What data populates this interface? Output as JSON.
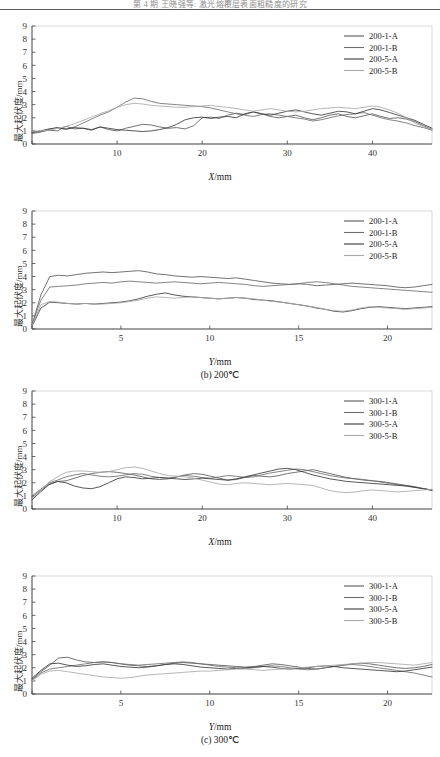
{
  "header": {
    "running_head": "第 4 期           王晓强等: 激光熔覆层表面粗糙度的研究",
    "visible": true
  },
  "axis_labels": {
    "y_title": "最大起伏度/mm",
    "x_title_x": "X",
    "x_title_y": "Y",
    "unit": "/mm"
  },
  "colors": {
    "series_a1": "#5a5a5a",
    "series_b1": "#6e6e6e",
    "series_a5": "#3a3a3a",
    "series_b5": "#a9a9a9",
    "axis": "#444444",
    "text": "#222222"
  },
  "chart_data": [
    {
      "id": "panel-a-x",
      "type": "line",
      "title": "",
      "xlabel": "X/mm",
      "ylabel": "最大起伏度/mm",
      "xlim": [
        0,
        47
      ],
      "ylim": [
        0,
        9
      ],
      "xticks": [
        0,
        10,
        20,
        30,
        40
      ],
      "yticks": [
        0,
        1,
        2,
        3,
        4,
        5,
        6,
        7,
        8,
        9
      ],
      "grid": false,
      "legend_position": "top-right",
      "x": [
        0,
        1,
        2,
        3,
        4,
        5,
        6,
        7,
        8,
        9,
        10,
        11,
        12,
        13,
        14,
        15,
        16,
        17,
        18,
        19,
        20,
        21,
        22,
        23,
        24,
        25,
        26,
        27,
        28,
        29,
        30,
        31,
        32,
        33,
        34,
        35,
        36,
        37,
        38,
        39,
        40,
        41,
        42,
        43,
        44,
        45,
        46,
        47
      ],
      "series": [
        {
          "name": "200-1-A",
          "values": [
            0.85,
            0.95,
            1.05,
            1.0,
            1.35,
            1.15,
            1.2,
            1.05,
            1.3,
            1.1,
            1.0,
            1.2,
            1.35,
            1.5,
            1.45,
            1.3,
            1.2,
            1.25,
            1.15,
            1.4,
            2.0,
            2.05,
            1.95,
            2.2,
            2.35,
            2.25,
            2.45,
            2.3,
            2.1,
            2.0,
            2.1,
            2.2,
            2.0,
            1.85,
            2.0,
            2.2,
            2.3,
            2.1,
            2.0,
            2.15,
            2.3,
            2.1,
            1.95,
            2.0,
            1.9,
            1.7,
            1.4,
            1.1
          ]
        },
        {
          "name": "200-1-B",
          "values": [
            0.8,
            0.9,
            1.1,
            1.25,
            1.1,
            1.3,
            1.6,
            1.9,
            2.2,
            2.45,
            2.8,
            3.2,
            3.5,
            3.45,
            3.25,
            3.1,
            3.05,
            3.0,
            2.95,
            2.9,
            2.85,
            2.75,
            2.6,
            2.45,
            2.3,
            2.2,
            2.1,
            2.25,
            2.3,
            2.2,
            2.1,
            2.0,
            1.9,
            1.75,
            1.85,
            2.0,
            2.15,
            2.25,
            2.3,
            2.4,
            2.2,
            2.0,
            1.85,
            1.75,
            1.6,
            1.4,
            1.25,
            1.05
          ]
        },
        {
          "name": "200-5-A",
          "values": [
            0.9,
            1.0,
            1.15,
            1.25,
            1.15,
            1.25,
            1.2,
            1.1,
            1.3,
            1.2,
            1.1,
            1.05,
            1.0,
            0.95,
            1.0,
            1.1,
            1.25,
            1.5,
            1.85,
            2.0,
            2.05,
            1.95,
            2.05,
            2.1,
            2.0,
            2.3,
            2.45,
            2.3,
            2.2,
            2.35,
            2.5,
            2.6,
            2.45,
            2.3,
            2.2,
            2.35,
            2.5,
            2.45,
            2.3,
            2.5,
            2.7,
            2.6,
            2.4,
            2.2,
            2.0,
            1.8,
            1.5,
            1.2
          ]
        },
        {
          "name": "200-5-B",
          "values": [
            0.95,
            1.0,
            1.05,
            1.2,
            1.35,
            1.55,
            1.8,
            2.05,
            2.3,
            2.55,
            2.8,
            3.0,
            3.1,
            3.05,
            2.95,
            2.9,
            2.85,
            2.8,
            2.8,
            2.85,
            2.9,
            2.95,
            2.85,
            2.8,
            2.7,
            2.6,
            2.5,
            2.6,
            2.7,
            2.6,
            2.5,
            2.45,
            2.5,
            2.6,
            2.7,
            2.75,
            2.8,
            2.75,
            2.7,
            2.8,
            2.9,
            2.8,
            2.6,
            2.35,
            2.0,
            1.6,
            1.3,
            1.1
          ]
        }
      ]
    },
    {
      "id": "panel-b-y",
      "type": "line",
      "title": "(b) 200℃",
      "xlabel": "Y/mm",
      "ylabel": "最大起伏度/mm",
      "xlim": [
        0,
        22.5
      ],
      "ylim": [
        0,
        9
      ],
      "xticks": [
        0,
        5,
        10,
        15,
        20
      ],
      "yticks": [
        0,
        1,
        2,
        3,
        4,
        5,
        6,
        7,
        8,
        9
      ],
      "grid": false,
      "legend_position": "top-right",
      "x": [
        0,
        0.5,
        1,
        1.5,
        2,
        2.5,
        3,
        3.5,
        4,
        4.5,
        5,
        5.5,
        6,
        6.5,
        7,
        7.5,
        8,
        8.5,
        9,
        9.5,
        10,
        10.5,
        11,
        11.5,
        12,
        12.5,
        13,
        13.5,
        14,
        14.5,
        15,
        15.5,
        16,
        16.5,
        17,
        17.5,
        18,
        18.5,
        19,
        19.5,
        20,
        20.5,
        21,
        21.5,
        22,
        22.5
      ],
      "series": [
        {
          "name": "200-1-A",
          "values": [
            0.3,
            2.6,
            4.0,
            4.1,
            4.05,
            4.15,
            4.25,
            4.3,
            4.35,
            4.3,
            4.35,
            4.4,
            4.45,
            4.35,
            4.2,
            4.15,
            4.05,
            4.0,
            3.95,
            4.0,
            3.95,
            3.9,
            3.85,
            3.9,
            3.8,
            3.7,
            3.6,
            3.5,
            3.45,
            3.4,
            3.45,
            3.4,
            3.3,
            3.35,
            3.4,
            3.45,
            3.5,
            3.45,
            3.4,
            3.35,
            3.3,
            3.2,
            3.15,
            3.2,
            3.3,
            3.4
          ]
        },
        {
          "name": "200-1-B",
          "values": [
            0.35,
            2.2,
            3.2,
            3.25,
            3.3,
            3.35,
            3.45,
            3.5,
            3.55,
            3.5,
            3.6,
            3.65,
            3.6,
            3.55,
            3.5,
            3.55,
            3.6,
            3.55,
            3.5,
            3.45,
            3.5,
            3.55,
            3.5,
            3.45,
            3.4,
            3.3,
            3.25,
            3.3,
            3.35,
            3.4,
            3.45,
            3.55,
            3.6,
            3.55,
            3.45,
            3.35,
            3.25,
            3.2,
            3.15,
            3.1,
            3.05,
            3.0,
            2.95,
            2.9,
            2.85,
            2.8
          ]
        },
        {
          "name": "200-5-A",
          "values": [
            0.2,
            1.6,
            2.05,
            2.0,
            1.95,
            1.9,
            1.95,
            1.9,
            1.95,
            2.0,
            2.05,
            2.15,
            2.3,
            2.5,
            2.65,
            2.75,
            2.6,
            2.5,
            2.45,
            2.4,
            2.35,
            2.3,
            2.35,
            2.4,
            2.35,
            2.25,
            2.2,
            2.15,
            2.05,
            1.95,
            1.85,
            1.75,
            1.6,
            1.5,
            1.35,
            1.3,
            1.4,
            1.55,
            1.65,
            1.7,
            1.65,
            1.6,
            1.55,
            1.6,
            1.65,
            1.7
          ]
        },
        {
          "name": "200-5-B",
          "values": [
            0.25,
            1.85,
            2.1,
            2.05,
            1.95,
            1.9,
            1.95,
            1.9,
            1.9,
            1.95,
            2.0,
            2.1,
            2.2,
            2.35,
            2.45,
            2.4,
            2.35,
            2.4,
            2.45,
            2.4,
            2.35,
            2.3,
            2.35,
            2.4,
            2.35,
            2.3,
            2.2,
            2.1,
            2.05,
            1.95,
            1.85,
            1.75,
            1.65,
            1.5,
            1.4,
            1.35,
            1.45,
            1.6,
            1.7,
            1.65,
            1.6,
            1.55,
            1.5,
            1.55,
            1.6,
            1.65
          ]
        }
      ]
    },
    {
      "id": "panel-c-x",
      "type": "line",
      "title": "",
      "xlabel": "X/mm",
      "ylabel": "最大起伏度/mm",
      "xlim": [
        0,
        47
      ],
      "ylim": [
        0,
        9
      ],
      "xticks": [
        0,
        10,
        20,
        30,
        40
      ],
      "yticks": [
        0,
        1,
        2,
        3,
        4,
        5,
        6,
        7,
        8,
        9
      ],
      "grid": false,
      "legend_position": "top-right",
      "x": [
        0,
        1,
        2,
        3,
        4,
        5,
        6,
        7,
        8,
        9,
        10,
        11,
        12,
        13,
        14,
        15,
        16,
        17,
        18,
        19,
        20,
        21,
        22,
        23,
        24,
        25,
        26,
        27,
        28,
        29,
        30,
        31,
        32,
        33,
        34,
        35,
        36,
        37,
        38,
        39,
        40,
        41,
        42,
        43,
        44,
        45,
        46,
        47
      ],
      "series": [
        {
          "name": "300-1-A",
          "values": [
            0.9,
            1.4,
            1.9,
            2.1,
            2.15,
            2.35,
            2.55,
            2.7,
            2.8,
            2.85,
            2.8,
            2.7,
            2.6,
            2.45,
            2.3,
            2.25,
            2.3,
            2.45,
            2.6,
            2.7,
            2.65,
            2.5,
            2.35,
            2.2,
            2.25,
            2.4,
            2.55,
            2.5,
            2.45,
            2.55,
            2.7,
            2.8,
            2.9,
            3.0,
            2.85,
            2.7,
            2.55,
            2.4,
            2.3,
            2.2,
            2.15,
            2.1,
            2.0,
            1.9,
            1.8,
            1.7,
            1.55,
            1.45
          ]
        },
        {
          "name": "300-1-B",
          "values": [
            1.0,
            1.5,
            2.0,
            2.2,
            2.45,
            2.6,
            2.7,
            2.6,
            2.5,
            2.45,
            2.5,
            2.6,
            2.7,
            2.65,
            2.5,
            2.4,
            2.35,
            2.45,
            2.55,
            2.5,
            2.4,
            2.35,
            2.45,
            2.55,
            2.5,
            2.4,
            2.45,
            2.6,
            2.75,
            2.85,
            2.95,
            3.05,
            3.0,
            2.85,
            2.7,
            2.55,
            2.45,
            2.35,
            2.3,
            2.25,
            2.15,
            2.05,
            1.95,
            1.85,
            1.75,
            1.65,
            1.55,
            1.4
          ]
        },
        {
          "name": "300-5-A",
          "values": [
            0.7,
            1.3,
            1.85,
            2.1,
            2.0,
            1.75,
            1.6,
            1.55,
            1.7,
            2.0,
            2.3,
            2.45,
            2.4,
            2.3,
            2.35,
            2.4,
            2.35,
            2.3,
            2.25,
            2.3,
            2.35,
            2.3,
            2.25,
            2.2,
            2.3,
            2.45,
            2.6,
            2.75,
            2.9,
            3.05,
            3.1,
            3.0,
            2.8,
            2.6,
            2.45,
            2.3,
            2.2,
            2.1,
            2.05,
            2.0,
            1.95,
            1.9,
            1.85,
            1.8,
            1.75,
            1.65,
            1.55,
            1.45
          ]
        },
        {
          "name": "300-5-B",
          "values": [
            0.8,
            1.45,
            2.05,
            2.45,
            2.8,
            2.9,
            2.9,
            2.85,
            2.8,
            2.85,
            3.0,
            3.15,
            3.2,
            3.1,
            2.9,
            2.7,
            2.55,
            2.5,
            2.45,
            2.35,
            2.2,
            2.05,
            1.9,
            1.85,
            1.95,
            2.0,
            1.95,
            1.9,
            1.85,
            1.9,
            1.95,
            1.9,
            1.85,
            1.8,
            1.6,
            1.4,
            1.3,
            1.25,
            1.3,
            1.4,
            1.45,
            1.4,
            1.35,
            1.3,
            1.35,
            1.4,
            1.45,
            1.5
          ]
        }
      ]
    },
    {
      "id": "panel-d-y",
      "type": "line",
      "title": "(c) 300℃",
      "xlabel": "Y/mm",
      "ylabel": "最大起伏度/mm",
      "xlim": [
        0,
        22.5
      ],
      "ylim": [
        0,
        9
      ],
      "xticks": [
        0,
        5,
        10,
        15,
        20
      ],
      "yticks": [
        0,
        1,
        2,
        3,
        4,
        5,
        6,
        7,
        8,
        9
      ],
      "grid": false,
      "legend_position": "top-right",
      "x": [
        0,
        0.5,
        1,
        1.5,
        2,
        2.5,
        3,
        3.5,
        4,
        4.5,
        5,
        5.5,
        6,
        6.5,
        7,
        7.5,
        8,
        8.5,
        9,
        9.5,
        10,
        10.5,
        11,
        11.5,
        12,
        12.5,
        13,
        13.5,
        14,
        14.5,
        15,
        15.5,
        16,
        16.5,
        17,
        17.5,
        18,
        18.5,
        19,
        19.5,
        20,
        20.5,
        21,
        21.5,
        22,
        22.5
      ],
      "series": [
        {
          "name": "300-1-A",
          "values": [
            1.1,
            1.7,
            2.2,
            2.75,
            2.8,
            2.6,
            2.45,
            2.4,
            2.45,
            2.4,
            2.3,
            2.2,
            2.15,
            2.1,
            2.15,
            2.25,
            2.35,
            2.4,
            2.35,
            2.3,
            2.25,
            2.2,
            2.15,
            2.1,
            2.05,
            2.1,
            2.2,
            2.3,
            2.25,
            2.15,
            2.05,
            1.95,
            1.9,
            2.0,
            2.1,
            2.2,
            2.3,
            2.35,
            2.3,
            2.2,
            2.1,
            2.0,
            1.95,
            2.0,
            2.1,
            2.25
          ]
        },
        {
          "name": "300-1-B",
          "values": [
            1.05,
            1.6,
            1.9,
            2.0,
            2.1,
            2.2,
            2.3,
            2.4,
            2.45,
            2.4,
            2.3,
            2.25,
            2.2,
            2.25,
            2.3,
            2.35,
            2.4,
            2.45,
            2.4,
            2.3,
            2.2,
            2.1,
            2.05,
            2.0,
            1.95,
            2.0,
            2.1,
            2.15,
            2.1,
            2.0,
            1.9,
            1.85,
            1.9,
            2.0,
            2.1,
            2.2,
            2.25,
            2.2,
            2.1,
            2.0,
            1.9,
            1.8,
            1.7,
            1.6,
            1.45,
            1.3
          ]
        },
        {
          "name": "300-5-A",
          "values": [
            1.2,
            1.8,
            2.3,
            2.35,
            2.2,
            2.1,
            2.15,
            2.25,
            2.3,
            2.2,
            2.1,
            2.05,
            2.0,
            2.05,
            2.15,
            2.25,
            2.3,
            2.25,
            2.15,
            2.05,
            2.0,
            1.95,
            1.9,
            1.95,
            2.0,
            2.05,
            2.1,
            2.05,
            1.95,
            1.9,
            1.95,
            2.0,
            2.1,
            2.15,
            2.1,
            2.0,
            1.95,
            1.9,
            1.85,
            1.8,
            1.75,
            1.7,
            1.75,
            1.85,
            1.95,
            2.05
          ]
        },
        {
          "name": "300-5-B",
          "values": [
            1.0,
            1.5,
            1.75,
            1.8,
            1.7,
            1.6,
            1.5,
            1.4,
            1.3,
            1.25,
            1.2,
            1.25,
            1.35,
            1.45,
            1.5,
            1.55,
            1.6,
            1.65,
            1.7,
            1.75,
            1.75,
            1.8,
            1.85,
            1.9,
            1.9,
            1.85,
            1.8,
            1.85,
            1.9,
            1.95,
            2.0,
            2.05,
            2.1,
            2.15,
            2.2,
            2.25,
            2.3,
            2.35,
            2.4,
            2.4,
            2.35,
            2.3,
            2.25,
            2.2,
            2.3,
            2.4
          ]
        }
      ]
    }
  ]
}
